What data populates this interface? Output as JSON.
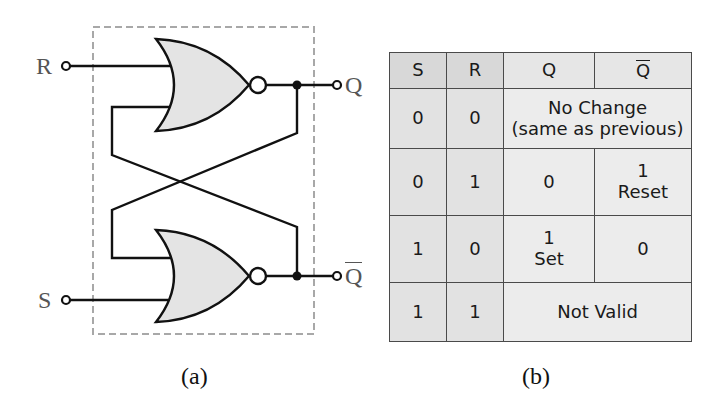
{
  "circuit": {
    "caption": "(a)",
    "inputs": [
      {
        "label": "R",
        "role": "reset input"
      },
      {
        "label": "S",
        "role": "set input"
      }
    ],
    "outputs": [
      {
        "label": "Q",
        "overline": false
      },
      {
        "label": "Q",
        "overline": true
      }
    ],
    "gates": [
      {
        "type": "NOR",
        "position": "top",
        "inputs": [
          "R",
          "Q-bar feedback"
        ],
        "output": "Q"
      },
      {
        "type": "NOR",
        "position": "bottom",
        "inputs": [
          "Q feedback",
          "S"
        ],
        "output": "Q-bar"
      }
    ],
    "colors": {
      "gate_fill": "#e4e4e4",
      "wire": "#111111",
      "dashed_box": "#a8a8a8",
      "label": "#555555"
    }
  },
  "truth_table": {
    "caption": "(b)",
    "headers": [
      {
        "label": "S",
        "overline": false
      },
      {
        "label": "R",
        "overline": false
      },
      {
        "label": "Q",
        "overline": false
      },
      {
        "label": "Q",
        "overline": true
      }
    ],
    "rows": [
      {
        "S": "0",
        "R": "0",
        "merged": true,
        "text_line1": "No Change",
        "text_line2": "(same as previous)"
      },
      {
        "S": "0",
        "R": "1",
        "merged": false,
        "Q": "0",
        "Qbar_line1": "1",
        "Qbar_line2": "Reset"
      },
      {
        "S": "1",
        "R": "0",
        "merged": false,
        "Q_line1": "1",
        "Q_line2": "Set",
        "Qbar": "0"
      },
      {
        "S": "1",
        "R": "1",
        "merged": true,
        "text_line1": "Not Valid"
      }
    ],
    "colors": {
      "header_bg": "#d8d8d8",
      "cell_bg": "#ececec",
      "border": "#4a4a4a"
    }
  }
}
